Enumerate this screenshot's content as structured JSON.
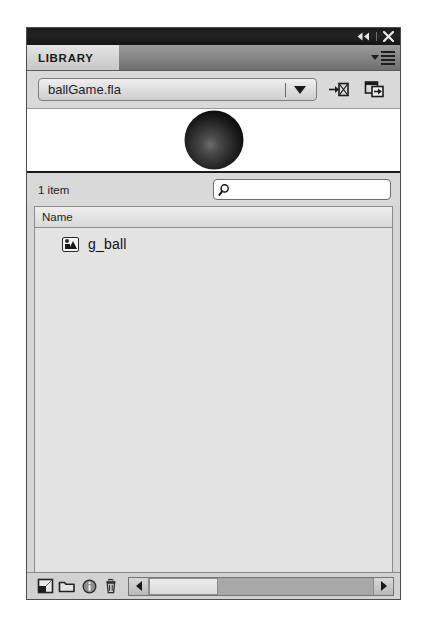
{
  "window": {
    "collapse_icon": "collapse-to-icons-icon",
    "close_icon": "close-icon"
  },
  "tabs": [
    {
      "label": "LIBRARY",
      "active": true
    }
  ],
  "panel_menu": {
    "icon": "panel-menu-icon"
  },
  "document_selector": {
    "value": "ballGame.fla",
    "dropdown_icon": "chevron-down-icon",
    "pin_button": "pin-current-library-icon",
    "new_panel_button": "new-library-panel-icon"
  },
  "preview": {
    "symbol_name": "g_ball",
    "shape": "sphere",
    "gradient_center": "#6d6d6d",
    "gradient_edge": "#000000"
  },
  "status": {
    "item_count": "1 item"
  },
  "search": {
    "value": "",
    "placeholder": "",
    "icon": "search-icon"
  },
  "list": {
    "columns": [
      {
        "label": "Name"
      }
    ],
    "items": [
      {
        "name": "g_ball",
        "icon": "graphic-symbol-icon"
      }
    ]
  },
  "toolbar": {
    "new_symbol": "new-symbol-icon",
    "new_folder": "new-folder-icon",
    "properties": "properties-info-icon",
    "delete": "delete-trash-icon"
  },
  "scrollbar": {
    "left_arrow": "scroll-left-icon",
    "right_arrow": "scroll-right-icon",
    "thumb_width_percent": 31
  },
  "colors": {
    "panel_bg": "#d6d6d6",
    "title_strip": "#1b1b1b",
    "tab_bar": "#858585",
    "list_bg": "#e3e3e3"
  }
}
